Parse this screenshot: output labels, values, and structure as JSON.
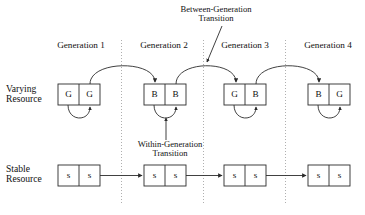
{
  "figure": {
    "title": "",
    "row_labels": [
      {
        "id": "varying-resource",
        "line1": "Varying",
        "line2": "Resource"
      },
      {
        "id": "stable-resource",
        "line1": "Stable",
        "line2": "Resource"
      }
    ],
    "generation_labels": [
      {
        "id": "generation-1",
        "text": "Generation 1"
      },
      {
        "id": "generation-2",
        "text": "Generation 2"
      },
      {
        "id": "generation-3",
        "text": "Generation 3"
      },
      {
        "id": "generation-4",
        "text": "Generation 4"
      }
    ],
    "annotations": [
      {
        "id": "between-generation-transition",
        "line1": "Between-Generation",
        "line2": "Transition"
      },
      {
        "id": "within-generation-transition",
        "line1": "Within-Generation",
        "line2": "Transition"
      }
    ],
    "varying_boxes": [
      {
        "id": "varying-box-1",
        "generation": "Generation 1",
        "left_cell": "G",
        "right_cell": "G"
      },
      {
        "id": "varying-box-2",
        "generation": "Generation 2",
        "left_cell": "B",
        "right_cell": "B"
      },
      {
        "id": "varying-box-3",
        "generation": "Generation 3",
        "left_cell": "G",
        "right_cell": "B"
      },
      {
        "id": "varying-box-4",
        "generation": "Generation 4",
        "left_cell": "B",
        "right_cell": "G"
      }
    ],
    "stable_boxes": [
      {
        "id": "stable-box-1",
        "generation": "Generation 1",
        "left_cell": "s",
        "right_cell": "s"
      },
      {
        "id": "stable-box-2",
        "generation": "Generation 2",
        "left_cell": "s",
        "right_cell": "s"
      },
      {
        "id": "stable-box-3",
        "generation": "Generation 3",
        "left_cell": "s",
        "right_cell": "s"
      },
      {
        "id": "stable-box-4",
        "generation": "Generation 4",
        "left_cell": "s",
        "right_cell": "s"
      }
    ],
    "colors": {
      "ink": "#111111",
      "line": "#2b2b2b",
      "divider": "#9a9a9a",
      "background": "#ffffff"
    }
  }
}
